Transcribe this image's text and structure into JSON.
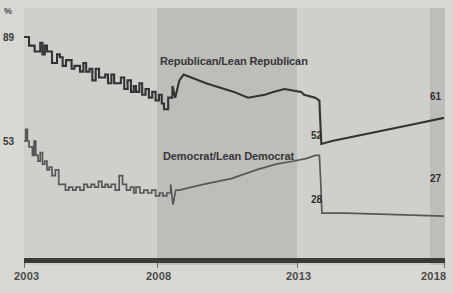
{
  "chart_data": {
    "type": "line",
    "title": "",
    "subtitle": "",
    "xlabel": "",
    "ylabel": "%",
    "yaxis_unit": "%",
    "xlim": [
      2003,
      2018
    ],
    "ylim": [
      20,
      92
    ],
    "grid": false,
    "legend": "inline-labels",
    "x_ticks": [
      "2003",
      "2008",
      "2013",
      "2018"
    ],
    "y_ticks": [
      "89",
      "53"
    ],
    "shaded_bands": [
      {
        "name": "2003-2008",
        "from": 2003,
        "to": 2008,
        "shade": "light"
      },
      {
        "name": "2008-2013",
        "from": 2008,
        "to": 2013,
        "shade": "dark"
      },
      {
        "name": "2013-2018",
        "from": 2013,
        "to": 2018,
        "shade": "light"
      },
      {
        "name": "2018-edge",
        "from": 2017.6,
        "to": 2018,
        "shade": "dark"
      }
    ],
    "series": [
      {
        "name": "Republican/Lean Republican",
        "color": "#333333",
        "start_value": 89,
        "pre_break_value": 52,
        "end_value": 61,
        "points": [
          [
            2003.0,
            89
          ],
          [
            2003.1,
            89
          ],
          [
            2003.18,
            86
          ],
          [
            2003.3,
            86
          ],
          [
            2003.38,
            84
          ],
          [
            2003.5,
            84
          ],
          [
            2003.58,
            87
          ],
          [
            2003.66,
            83
          ],
          [
            2003.74,
            86
          ],
          [
            2003.82,
            84
          ],
          [
            2003.9,
            84
          ],
          [
            2004.0,
            80
          ],
          [
            2004.1,
            80
          ],
          [
            2004.18,
            83
          ],
          [
            2004.28,
            82
          ],
          [
            2004.38,
            79
          ],
          [
            2004.5,
            81
          ],
          [
            2004.6,
            81
          ],
          [
            2004.7,
            78
          ],
          [
            2004.8,
            79
          ],
          [
            2004.9,
            79
          ],
          [
            2005.0,
            77
          ],
          [
            2005.12,
            80
          ],
          [
            2005.22,
            77
          ],
          [
            2005.34,
            78
          ],
          [
            2005.44,
            74
          ],
          [
            2005.56,
            78
          ],
          [
            2005.68,
            75
          ],
          [
            2005.78,
            75
          ],
          [
            2005.9,
            76
          ],
          [
            2006.0,
            73
          ],
          [
            2006.12,
            76
          ],
          [
            2006.22,
            73
          ],
          [
            2006.34,
            73
          ],
          [
            2006.46,
            75
          ],
          [
            2006.58,
            71
          ],
          [
            2006.7,
            74
          ],
          [
            2006.82,
            70
          ],
          [
            2006.92,
            72
          ],
          [
            2007.0,
            70
          ],
          [
            2007.12,
            73
          ],
          [
            2007.22,
            69
          ],
          [
            2007.34,
            71
          ],
          [
            2007.46,
            68
          ],
          [
            2007.58,
            70
          ],
          [
            2007.7,
            67
          ],
          [
            2007.82,
            69
          ],
          [
            2007.92,
            66
          ],
          [
            2008.0,
            64
          ],
          [
            2008.15,
            68
          ],
          [
            2008.3,
            72
          ],
          [
            2008.4,
            68
          ],
          [
            2008.55,
            74
          ],
          [
            2008.7,
            76
          ],
          [
            2009.5,
            73
          ],
          [
            2010.5,
            70
          ],
          [
            2011.0,
            68
          ],
          [
            2011.6,
            69
          ],
          [
            2011.9,
            70
          ],
          [
            2012.3,
            71
          ],
          [
            2012.9,
            70
          ],
          [
            2013.0,
            69
          ],
          [
            2013.4,
            68
          ],
          [
            2013.55,
            67
          ],
          [
            2013.58,
            60
          ],
          [
            2013.62,
            52
          ],
          [
            2014.0,
            53
          ],
          [
            2015.0,
            55
          ],
          [
            2016.0,
            57
          ],
          [
            2017.0,
            59
          ],
          [
            2018.0,
            61
          ]
        ]
      },
      {
        "name": "Democrat/Lean Democrat",
        "color": "#585858",
        "start_value": 53,
        "pre_break_value": 28,
        "end_value": 27,
        "points": [
          [
            2003.0,
            53
          ],
          [
            2003.06,
            57
          ],
          [
            2003.12,
            53
          ],
          [
            2003.18,
            51
          ],
          [
            2003.24,
            51
          ],
          [
            2003.3,
            48
          ],
          [
            2003.36,
            53
          ],
          [
            2003.42,
            48
          ],
          [
            2003.5,
            46
          ],
          [
            2003.58,
            49
          ],
          [
            2003.66,
            45
          ],
          [
            2003.74,
            46
          ],
          [
            2003.82,
            43
          ],
          [
            2003.9,
            44
          ],
          [
            2004.0,
            41
          ],
          [
            2004.12,
            43
          ],
          [
            2004.24,
            38
          ],
          [
            2004.36,
            38
          ],
          [
            2004.48,
            36
          ],
          [
            2004.6,
            37
          ],
          [
            2004.74,
            36
          ],
          [
            2004.86,
            37
          ],
          [
            2005.0,
            36
          ],
          [
            2005.14,
            38
          ],
          [
            2005.26,
            37
          ],
          [
            2005.4,
            38
          ],
          [
            2005.52,
            37
          ],
          [
            2005.66,
            39
          ],
          [
            2005.78,
            37
          ],
          [
            2005.9,
            38
          ],
          [
            2006.0,
            37
          ],
          [
            2006.12,
            38
          ],
          [
            2006.26,
            36
          ],
          [
            2006.4,
            41
          ],
          [
            2006.52,
            38
          ],
          [
            2006.66,
            36
          ],
          [
            2006.8,
            37
          ],
          [
            2006.92,
            35
          ],
          [
            2007.0,
            37
          ],
          [
            2007.14,
            35
          ],
          [
            2007.28,
            36
          ],
          [
            2007.42,
            35
          ],
          [
            2007.56,
            36
          ],
          [
            2007.7,
            34
          ],
          [
            2007.84,
            35
          ],
          [
            2007.96,
            34
          ],
          [
            2008.1,
            35
          ],
          [
            2008.24,
            38
          ],
          [
            2008.32,
            31
          ],
          [
            2008.42,
            36
          ],
          [
            2008.55,
            36
          ],
          [
            2009.4,
            38
          ],
          [
            2010.4,
            40
          ],
          [
            2011.3,
            43
          ],
          [
            2012.0,
            45
          ],
          [
            2012.6,
            46
          ],
          [
            2013.1,
            47
          ],
          [
            2013.4,
            48
          ],
          [
            2013.55,
            48
          ],
          [
            2013.6,
            38
          ],
          [
            2013.64,
            28
          ],
          [
            2014.5,
            28
          ],
          [
            2016.0,
            27.6
          ],
          [
            2018.0,
            27
          ]
        ]
      }
    ],
    "annotations": [
      {
        "text": "Republican/Lean Republican",
        "series": "Republican/Lean Republican"
      },
      {
        "text": "Democrat/Lean Democrat",
        "series": "Democrat/Lean Democrat"
      },
      {
        "text": "61",
        "value": 61,
        "series": "Republican/Lean Republican",
        "position": "end"
      },
      {
        "text": "52",
        "value": 52,
        "series": "Republican/Lean Republican",
        "position": "break"
      },
      {
        "text": "28",
        "value": 28,
        "series": "Democrat/Lean Democrat",
        "position": "break"
      },
      {
        "text": "27",
        "value": 27,
        "series": "Democrat/Lean Democrat",
        "position": "end"
      }
    ]
  },
  "axis": {
    "y_unit": "%",
    "y_tick_high": "89",
    "y_tick_low": "53",
    "x_ticks": [
      {
        "label": "2003"
      },
      {
        "label": "2008"
      },
      {
        "label": "2013"
      },
      {
        "label": "2018"
      }
    ]
  },
  "labels": {
    "republican": "Republican/Lean Republican",
    "democrat": "Democrat/Lean Democrat",
    "val_61": "61",
    "val_52": "52",
    "val_28": "28",
    "val_27": "27"
  },
  "colors": {
    "republican_line": "#333333",
    "democrat_line": "#585858",
    "background": "#d7d7d3",
    "band_light": "#cfcfcb",
    "band_dark": "#bdbdb9",
    "axis": "#3a3a38",
    "text": "#37373a"
  }
}
